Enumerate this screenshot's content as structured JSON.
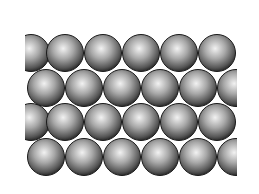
{
  "figure": {
    "background": "#ffffff",
    "clip": {
      "x": 25,
      "y": 34,
      "width": 212,
      "height": 144
    },
    "sphere_radius": 18.5,
    "rows": [
      {
        "cy": 53,
        "cx": [
          31,
          65,
          103,
          141,
          179,
          217
        ]
      },
      {
        "cy": 88,
        "cx": [
          46,
          84,
          122,
          160,
          198,
          236
        ]
      },
      {
        "cy": 122,
        "cx": [
          31,
          65,
          103,
          141,
          179,
          217
        ]
      },
      {
        "cy": 157,
        "cx": [
          46,
          84,
          122,
          160,
          198,
          236
        ]
      }
    ],
    "colors": {
      "highlight": "#f2f2f2",
      "mid": "#9a9a9a",
      "shadow": "#3a3a3a",
      "outline": "#1a1a1a"
    }
  }
}
